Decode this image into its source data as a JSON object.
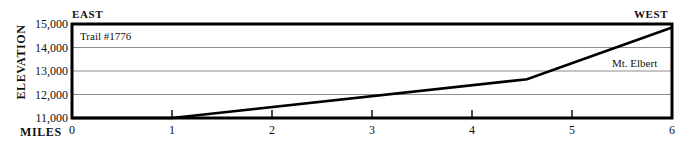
{
  "figure": {
    "orientation_left": "EAST",
    "orientation_right": "WEST",
    "yaxis_title": "ELEVATION",
    "xaxis_title": "MILES",
    "trail_annotation": "Trail #1776",
    "peak_annotation": "Mt. Elbert",
    "line_color": "#000000",
    "grid_color": "#8c8c8c",
    "border_color": "#000000",
    "background_color": "#ffffff"
  },
  "chart_data": {
    "type": "line",
    "title": "Trail #1776",
    "xlabel": "MILES",
    "ylabel": "ELEVATION",
    "xlim": [
      0,
      6
    ],
    "ylim": [
      11000,
      15000
    ],
    "grid": true,
    "legend_position": "none",
    "xticks": [
      0,
      1,
      2,
      3,
      4,
      5,
      6
    ],
    "xtick_labels": [
      "0",
      "1",
      "2",
      "3",
      "4",
      "5",
      "6"
    ],
    "yticks": [
      11000,
      12000,
      13000,
      14000,
      15000
    ],
    "ytick_labels": [
      "11,000",
      "12,000",
      "13,000",
      "14,000",
      "15,000"
    ],
    "series": [
      {
        "name": "Trail #1776 elevation profile",
        "x": [
          0,
          1,
          4.55,
          6
        ],
        "values": [
          11000,
          11000,
          12650,
          14850
        ]
      }
    ],
    "annotations": [
      {
        "text": "Trail #1776",
        "x": 0.1,
        "y": 14700
      },
      {
        "text": "Mt. Elbert",
        "x": 5.45,
        "y": 13250
      },
      {
        "text": "EAST",
        "x": 0,
        "y": 15000
      },
      {
        "text": "WEST",
        "x": 6,
        "y": 15000
      }
    ]
  }
}
